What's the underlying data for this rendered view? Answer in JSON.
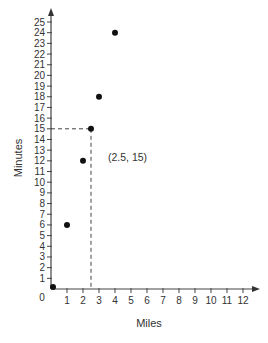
{
  "chart_data": {
    "type": "scatter",
    "title": "",
    "xlabel": "Miles",
    "ylabel": "Minutes",
    "xlim": [
      0,
      12
    ],
    "ylim": [
      0,
      25
    ],
    "x_ticks": [
      1,
      2,
      3,
      4,
      5,
      6,
      7,
      8,
      9,
      10,
      11,
      12
    ],
    "y_ticks": [
      1,
      2,
      3,
      4,
      5,
      6,
      7,
      8,
      9,
      10,
      11,
      12,
      13,
      14,
      15,
      16,
      17,
      18,
      19,
      20,
      21,
      22,
      23,
      24,
      25
    ],
    "origin_label": "0",
    "grid": false,
    "legend": null,
    "series": [
      {
        "name": "points",
        "points": [
          {
            "x": 0,
            "y": 0
          },
          {
            "x": 1,
            "y": 6
          },
          {
            "x": 2,
            "y": 12
          },
          {
            "x": 2.5,
            "y": 15
          },
          {
            "x": 3,
            "y": 18
          },
          {
            "x": 4,
            "y": 24
          }
        ]
      }
    ],
    "annotations": [
      {
        "text": "(2.5, 15)",
        "x": 2.5,
        "y": 15,
        "guide_lines": "dashed to both axes"
      }
    ]
  }
}
